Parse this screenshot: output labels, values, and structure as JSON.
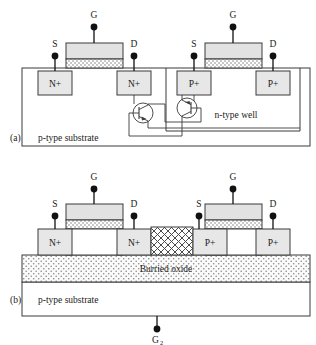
{
  "figure": {
    "panels": [
      {
        "tag": "(a)",
        "name": "bulk-cmos-latchup",
        "substrate_label": "p-type substrate",
        "well_label": "n-type well",
        "devices": [
          {
            "name": "nmos",
            "terminals": [
              "S",
              "G",
              "D"
            ],
            "diffusions": [
              "N+",
              "N+"
            ]
          },
          {
            "name": "pmos",
            "terminals": [
              "S",
              "G",
              "D"
            ],
            "diffusions": [
              "P+",
              "P+"
            ]
          }
        ],
        "parasitic_transistors": [
          {
            "name": "npn-bjt",
            "type": "npn"
          },
          {
            "name": "pnp-bjt",
            "type": "pnp"
          }
        ]
      },
      {
        "tag": "(b)",
        "name": "soi-cmos",
        "substrate_label": "p-type substrate",
        "oxide_label": "Burried oxide",
        "back_gate": "G",
        "back_gate_sub": "2",
        "devices": [
          {
            "name": "nmos",
            "terminals": [
              "S",
              "G",
              "D"
            ],
            "diffusions": [
              "N+",
              "N+"
            ]
          },
          {
            "name": "pmos",
            "terminals": [
              "S",
              "G",
              "D"
            ],
            "diffusions": [
              "P+",
              "P+"
            ]
          }
        ],
        "isolation": "sti-trench"
      }
    ],
    "colors": {
      "line": "#3a3a3a",
      "fill_block": "#e2e2e2",
      "fill_white": "#ffffff",
      "terminal": "#111111"
    }
  }
}
